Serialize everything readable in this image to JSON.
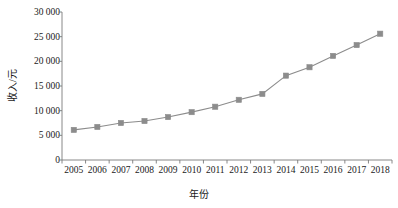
{
  "chart_data": {
    "type": "line",
    "title": "",
    "xlabel": "年份",
    "ylabel": "收入/元",
    "categories": [
      "2005",
      "2006",
      "2007",
      "2008",
      "2009",
      "2010",
      "2011",
      "2012",
      "2013",
      "2014",
      "2015",
      "2016",
      "2017",
      "2018"
    ],
    "values": [
      6100,
      6700,
      7500,
      7900,
      8700,
      9700,
      10800,
      12200,
      13400,
      17100,
      18800,
      21100,
      23300,
      25600
    ],
    "series": [
      {
        "name": "收入",
        "values": [
          6100,
          6700,
          7500,
          7900,
          8700,
          9700,
          10800,
          12200,
          13400,
          17100,
          18800,
          21100,
          23300,
          25600
        ]
      }
    ],
    "ylim": [
      0,
      30000
    ],
    "yticks": [
      0,
      5000,
      10000,
      15000,
      20000,
      25000,
      30000
    ],
    "ytick_labels": [
      "0",
      "5 000",
      "10 000",
      "15 000",
      "20 000",
      "25 000",
      "30 000"
    ],
    "grid": false,
    "legend": false,
    "legend_position": "none",
    "marker": "square",
    "line_color": "#8c8c8c",
    "marker_color": "#8c8c8c",
    "axis_color": "#7a7a7a",
    "text_color": "#1a1a1a"
  }
}
